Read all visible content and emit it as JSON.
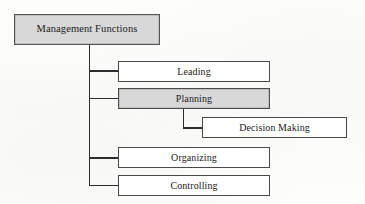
{
  "diagram": {
    "title": "Management Functions",
    "type": "hierarchy-tree",
    "orientation": "left-trunk-vertical",
    "colors": {
      "shaded_fill": "#d8d8d8",
      "plain_fill": "#ffffff",
      "border": "#4a4a4a",
      "connector": "#2d2d2d",
      "text": "#1b1b1b",
      "page_background": "#fdfdfc"
    },
    "root": {
      "label": "Management Functions",
      "shaded": true
    },
    "nodes": [
      {
        "id": "leading",
        "label": "Leading",
        "shaded": false,
        "level": 2
      },
      {
        "id": "planning",
        "label": "Planning",
        "shaded": true,
        "level": 2
      },
      {
        "id": "decision_making",
        "label": "Decision Making",
        "shaded": false,
        "level": 3,
        "parent": "planning"
      },
      {
        "id": "organizing",
        "label": "Organizing",
        "shaded": false,
        "level": 2
      },
      {
        "id": "controlling",
        "label": "Controlling",
        "shaded": false,
        "level": 2
      }
    ]
  }
}
